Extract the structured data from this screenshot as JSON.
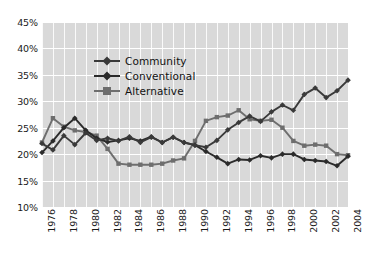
{
  "chart_data": {
    "type": "line",
    "title": "",
    "xlabel": "",
    "ylabel": "",
    "ylim": [
      10,
      45
    ],
    "ytick_labels": [
      "10%",
      "15%",
      "20%",
      "25%",
      "30%",
      "35%",
      "40%",
      "45%"
    ],
    "ytick_values": [
      10,
      15,
      20,
      25,
      30,
      35,
      40,
      45
    ],
    "grid": true,
    "legend_position": "upper-left",
    "x": [
      1976,
      1977,
      1978,
      1979,
      1980,
      1981,
      1982,
      1983,
      1984,
      1985,
      1986,
      1987,
      1988,
      1989,
      1990,
      1991,
      1992,
      1993,
      1994,
      1995,
      1996,
      1997,
      1998,
      1999,
      2000,
      2001,
      2002,
      2003,
      2004
    ],
    "xtick_labels": [
      "1976",
      "1978",
      "1980",
      "1982",
      "1984",
      "1986",
      "1988",
      "1990",
      "1992",
      "1994",
      "1996",
      "1998",
      "2000",
      "2002",
      "2004"
    ],
    "xtick_values": [
      1976,
      1978,
      1980,
      1982,
      1984,
      1986,
      1988,
      1990,
      1992,
      1994,
      1996,
      1998,
      2000,
      2002,
      2004
    ],
    "series": [
      {
        "name": "Community",
        "color": "#3a3a3a",
        "marker": "diamond",
        "values": [
          22.0,
          20.8,
          23.5,
          21.8,
          24.0,
          22.6,
          23.0,
          22.5,
          23.3,
          22.2,
          23.2,
          22.2,
          23.2,
          22.2,
          21.7,
          21.3,
          22.6,
          24.6,
          26.0,
          27.2,
          26.2,
          28.0,
          29.3,
          28.3,
          31.3,
          32.5,
          30.7,
          32.0,
          34.0
        ]
      },
      {
        "name": "Conventional",
        "color": "#2b2b2b",
        "marker": "diamond",
        "values": [
          20.3,
          22.5,
          25.0,
          26.8,
          24.5,
          23.0,
          22.3,
          22.6,
          23.0,
          22.5,
          23.3,
          22.2,
          23.2,
          22.2,
          21.7,
          20.5,
          19.4,
          18.2,
          19.0,
          18.9,
          19.7,
          19.3,
          20.0,
          20.0,
          19.0,
          18.8,
          18.6,
          17.8,
          19.6
        ]
      },
      {
        "name": "Alternative",
        "color": "#6e6e6e",
        "marker": "square",
        "values": [
          22.2,
          26.8,
          25.2,
          24.5,
          24.2,
          23.5,
          21.0,
          18.2,
          18.0,
          18.0,
          18.0,
          18.2,
          18.8,
          19.2,
          22.5,
          26.3,
          27.0,
          27.3,
          28.3,
          26.6,
          26.3,
          26.5,
          25.0,
          22.5,
          21.6,
          21.8,
          21.6,
          20.0,
          19.8
        ]
      }
    ]
  },
  "legend": {
    "items": [
      {
        "label": "Community"
      },
      {
        "label": "Conventional"
      },
      {
        "label": "Alternative"
      }
    ]
  }
}
